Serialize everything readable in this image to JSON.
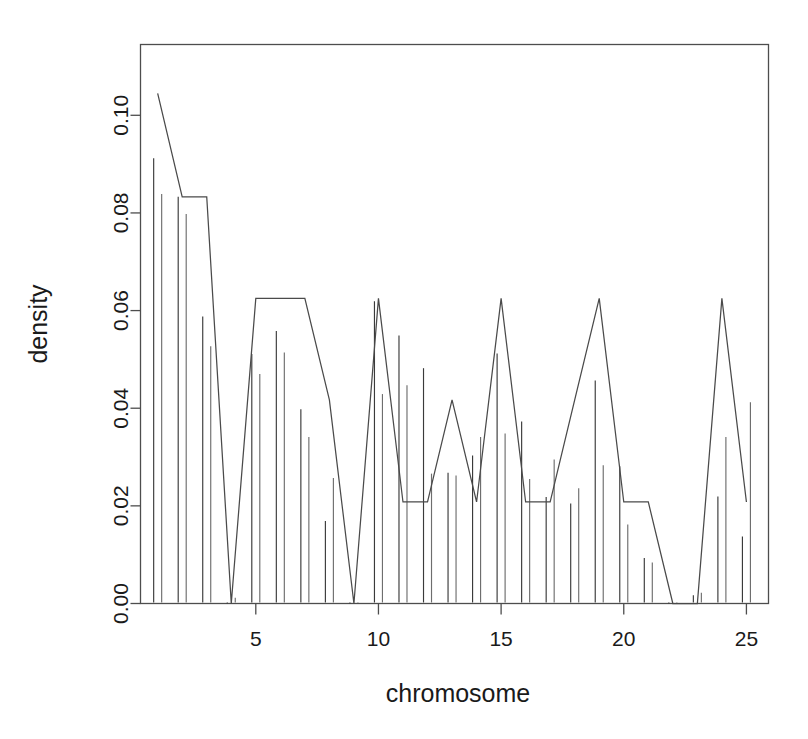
{
  "chart_data": {
    "type": "line",
    "title": "",
    "xlabel": "chromosome",
    "ylabel": "density",
    "xlim": [
      0.3,
      25.9
    ],
    "ylim": [
      0.0,
      0.1145
    ],
    "grid": false,
    "legend": "none",
    "x_ticks": [
      5,
      10,
      15,
      20,
      25
    ],
    "x_tick_labels": [
      "5",
      "10",
      "15",
      "20",
      "25"
    ],
    "y_ticks": [
      0.0,
      0.02,
      0.04,
      0.06,
      0.08,
      0.1
    ],
    "y_tick_labels": [
      "0.00",
      "0.02",
      "0.04",
      "0.06",
      "0.08",
      "0.10"
    ],
    "categories": [
      1,
      2,
      3,
      4,
      5,
      6,
      7,
      8,
      9,
      10,
      11,
      12,
      13,
      14,
      15,
      16,
      17,
      18,
      19,
      20,
      21,
      22,
      23,
      24,
      25
    ],
    "series": [
      {
        "name": "trend",
        "type": "line",
        "values": [
          0.1045,
          0.0833,
          0.0833,
          0.0,
          0.0625,
          0.0625,
          0.0625,
          0.0417,
          0.0,
          0.0625,
          0.0208,
          0.0208,
          0.0417,
          0.0208,
          0.0625,
          0.0208,
          0.0208,
          0.0417,
          0.0625,
          0.0208,
          0.0208,
          0.0,
          0.0,
          0.0625,
          0.0208
        ]
      },
      {
        "name": "needles-left",
        "type": "needle",
        "values": [
          0.0912,
          0.0833,
          0.0588,
          0.0,
          0.0511,
          0.0558,
          0.0398,
          0.0169,
          0.0,
          0.0619,
          0.0549,
          0.0482,
          0.0268,
          0.0303,
          0.0512,
          0.0373,
          0.0218,
          0.0205,
          0.0457,
          0.0281,
          0.0093,
          0.0,
          0.0017,
          0.0219,
          0.0137
        ]
      },
      {
        "name": "needles-right",
        "type": "needle",
        "values": [
          0.0839,
          0.0798,
          0.0527,
          0.0012,
          0.047,
          0.0514,
          0.0341,
          0.0257,
          0.0003,
          0.0429,
          0.0447,
          0.0266,
          0.0262,
          0.0341,
          0.0348,
          0.0255,
          0.0295,
          0.0236,
          0.0283,
          0.0162,
          0.0084,
          0.0,
          0.0022,
          0.0341,
          0.0412
        ]
      }
    ]
  },
  "axes": {
    "y_label": "density",
    "x_label": "chromosome"
  }
}
